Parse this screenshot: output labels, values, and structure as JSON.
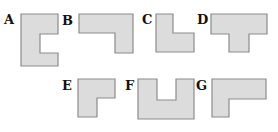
{
  "figure": {
    "colors": {
      "fill": "#dcdcdc",
      "stroke": "#8c8c8c",
      "label": "#111111"
    },
    "shapes": [
      {
        "label": "A",
        "label_pos": [
          4,
          24
        ],
        "points": "21,14 58,14 58,34 40,34 40,53 58,53 58,66 21,66"
      },
      {
        "label": "B",
        "label_pos": [
          62,
          25
        ],
        "points": "79,14 133,14 133,53 115,53 115,33 79,33"
      },
      {
        "label": "C",
        "label_pos": [
          142,
          24
        ],
        "points": "156,14 173,14 173,33 194,33 194,52 156,52"
      },
      {
        "label": "D",
        "label_pos": [
          197,
          24
        ],
        "points": "211,14 267,14 267,34 249,34 249,52 229,52 229,34 211,34"
      },
      {
        "label": "E",
        "label_pos": [
          62,
          90
        ],
        "points": "78,79 115,79 115,98 97,98 97,117 78,117"
      },
      {
        "label": "F",
        "label_pos": [
          125,
          90
        ],
        "points": "138,79 157,79 157,100 176,100 176,79 194,79 194,119 138,119"
      },
      {
        "label": "G",
        "label_pos": [
          196,
          90
        ],
        "points": "212,79 266,79 266,99 229,99 229,117 212,117"
      }
    ]
  }
}
